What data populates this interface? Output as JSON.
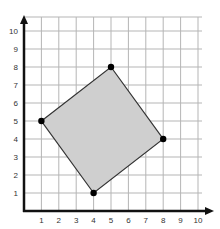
{
  "chart_data": {
    "type": "scatter",
    "title": "",
    "xlabel": "",
    "ylabel": "",
    "xlim": [
      0,
      10
    ],
    "ylim": [
      0,
      10
    ],
    "grid": true,
    "x_ticks": [
      "1",
      "2",
      "3",
      "4",
      "5",
      "6",
      "7",
      "8",
      "9",
      "10"
    ],
    "y_ticks": [
      "1",
      "2",
      "3",
      "4",
      "5",
      "6",
      "7",
      "8",
      "9",
      "10"
    ],
    "series": [
      {
        "name": "polygon-vertices",
        "shape": "filled-quadrilateral",
        "points": [
          {
            "x": 1,
            "y": 5
          },
          {
            "x": 5,
            "y": 8
          },
          {
            "x": 8,
            "y": 4
          },
          {
            "x": 4,
            "y": 1
          }
        ]
      }
    ],
    "legend": "none"
  },
  "colors": {
    "fill": "#cfcfcf",
    "edge": "#333333",
    "grid": "#b5b5b5",
    "axis": "#111111",
    "point": "#000000"
  }
}
